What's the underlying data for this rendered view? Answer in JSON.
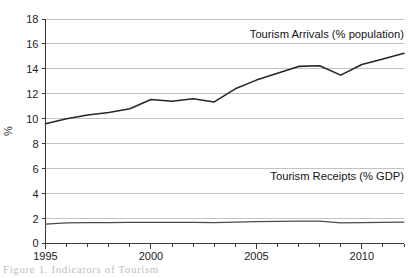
{
  "figure": {
    "caption": "Figure 1.  Indicators of Tourism"
  },
  "chart_data": {
    "type": "line",
    "title": "",
    "xlabel": "",
    "ylabel": "%",
    "xlim": [
      1995,
      2012
    ],
    "ylim": [
      0,
      18
    ],
    "ytick_step": 2,
    "yticks": [
      "0",
      "2",
      "4",
      "6",
      "8",
      "10",
      "12",
      "14",
      "16",
      "18"
    ],
    "xticks_major": [
      "1995",
      "2000",
      "2005",
      "2010"
    ],
    "x": [
      1995,
      1996,
      1997,
      1998,
      1999,
      2000,
      2001,
      2002,
      2003,
      2004,
      2005,
      2006,
      2007,
      2008,
      2009,
      2010,
      2011,
      2012
    ],
    "grid": "horizontal",
    "legend_position": "inline-annotation",
    "series": [
      {
        "name": "Tourism Arrivals (% population)",
        "color": "#262626",
        "values": [
          9.6,
          10.0,
          10.3,
          10.5,
          10.8,
          11.55,
          11.4,
          11.6,
          11.35,
          12.4,
          13.1,
          13.65,
          14.2,
          14.25,
          13.5,
          14.35,
          14.8,
          15.25
        ],
        "annotation": "Tourism Arrivals (% population)",
        "annotation_x": 2012,
        "annotation_y": 16.5
      },
      {
        "name": "Tourism Receipts (% GDP)",
        "color": "#4a4a4a",
        "values": [
          1.55,
          1.65,
          1.68,
          1.68,
          1.69,
          1.7,
          1.7,
          1.7,
          1.68,
          1.72,
          1.75,
          1.78,
          1.8,
          1.8,
          1.65,
          1.68,
          1.7,
          1.72
        ],
        "annotation": "Tourism Receipts (% GDP)",
        "annotation_x": 2012,
        "annotation_y": 5.1
      }
    ]
  }
}
